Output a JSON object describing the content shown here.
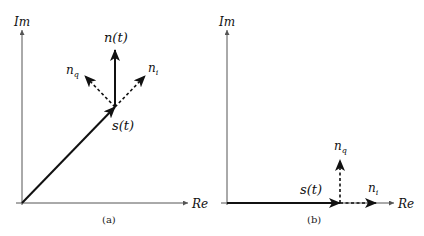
{
  "figure": {
    "panel_a": {
      "caption": "(a)",
      "axes": {
        "x_label": "Re",
        "y_label": "Im"
      },
      "vectors": {
        "signal": {
          "label": "s(t)",
          "style": "solid"
        },
        "noise": {
          "label": "n(t)",
          "style": "solid"
        },
        "noise_inphase": {
          "label_base": "n",
          "label_sub": "i",
          "style": "dashed"
        },
        "noise_quadrature": {
          "label_base": "n",
          "label_sub": "q",
          "style": "dashed"
        }
      }
    },
    "panel_b": {
      "caption": "(b)",
      "axes": {
        "x_label": "Re",
        "y_label": "Im"
      },
      "vectors": {
        "signal": {
          "label": "s(t)",
          "style": "solid"
        },
        "noise_inphase": {
          "label_base": "n",
          "label_sub": "i",
          "style": "dashed"
        },
        "noise_quadrature": {
          "label_base": "n",
          "label_sub": "q",
          "style": "dashed"
        }
      }
    },
    "colors": {
      "ink": "#111111",
      "axis": "#555555",
      "background": "#ffffff"
    }
  }
}
